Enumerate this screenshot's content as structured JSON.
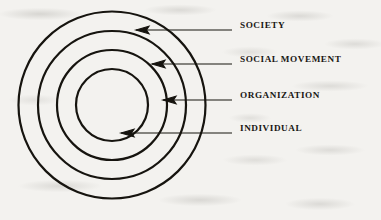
{
  "diagram": {
    "type": "concentric-circles",
    "stroke_color": "#16140f",
    "background_color": "#f3f2ef",
    "center": {
      "x": 112,
      "y": 105
    },
    "rings": [
      {
        "id": "society",
        "label": "SOCIETY",
        "radius": 93.5,
        "level": 1
      },
      {
        "id": "social-movement",
        "label": "SOCIAL MOVEMENT",
        "radius": 74,
        "level": 2
      },
      {
        "id": "organization",
        "label": "ORGANIZATION",
        "radius": 55,
        "level": 3
      },
      {
        "id": "individual",
        "label": "INDIVIDUAL",
        "radius": 36,
        "level": 4
      }
    ],
    "callouts": [
      {
        "id": "society",
        "label": "SOCIETY",
        "arrow_y": 30,
        "arrow_tip_x": 136,
        "leader_end_x": 232,
        "label_x": 240,
        "label_y": 25
      },
      {
        "id": "social-movement",
        "label": "SOCIAL MOVEMENT",
        "arrow_y": 64,
        "arrow_tip_x": 152,
        "leader_end_x": 232,
        "label_x": 240,
        "label_y": 59
      },
      {
        "id": "organization",
        "label": "ORGANIZATION",
        "arrow_y": 100,
        "arrow_tip_x": 163,
        "leader_end_x": 232,
        "label_x": 240,
        "label_y": 95
      },
      {
        "id": "individual",
        "label": "INDIVIDUAL",
        "arrow_y": 133,
        "arrow_tip_x": 121,
        "leader_end_x": 232,
        "label_x": 240,
        "label_y": 128
      }
    ]
  }
}
